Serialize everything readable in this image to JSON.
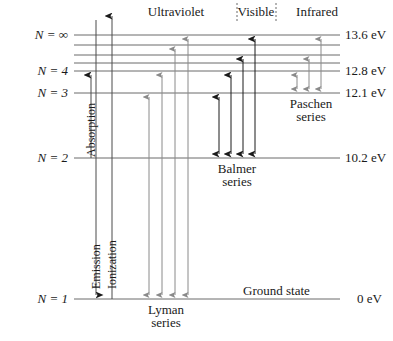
{
  "figure": {
    "type": "energy-level-diagram",
    "width": 393,
    "height": 341,
    "background": "#ffffff",
    "line_color": "#6b6b6b",
    "dark_arrow_color": "#1a1a1a",
    "gray_arrow_color": "#8a8a8a"
  },
  "levels": [
    {
      "name_prefix": "N",
      "eq": "=",
      "value": "∞",
      "label": "N = ∞",
      "energy": "13.6 eV",
      "y": 35,
      "labeled": true
    },
    {
      "name_prefix": "N",
      "eq": "=",
      "value": "7",
      "label": "",
      "energy": "",
      "y": 45,
      "labeled": false
    },
    {
      "name_prefix": "N",
      "eq": "=",
      "value": "6",
      "label": "",
      "energy": "",
      "y": 55,
      "labeled": false
    },
    {
      "name_prefix": "N",
      "eq": "=",
      "value": "5",
      "label": "",
      "energy": "",
      "y": 63,
      "labeled": false
    },
    {
      "name_prefix": "N",
      "eq": "=",
      "value": "4",
      "label": "N = 4",
      "energy": "12.8 eV",
      "y": 71,
      "labeled": true
    },
    {
      "name_prefix": "N",
      "eq": "=",
      "value": "3",
      "label": "N = 3",
      "energy": "12.1 eV",
      "y": 93,
      "labeled": true
    },
    {
      "name_prefix": "N",
      "eq": "=",
      "value": "2",
      "label": "N = 2",
      "energy": "10.2 eV",
      "y": 158,
      "labeled": true
    },
    {
      "name_prefix": "N",
      "eq": "=",
      "value": "1",
      "label": "N = 1",
      "energy": "0 eV",
      "y": 299,
      "labeled": true
    }
  ],
  "energy_axis": {
    "values": [
      "13.6 eV",
      "12.8 eV",
      "12.1 eV",
      "10.2 eV",
      "0 eV"
    ]
  },
  "spectrum_regions": [
    {
      "label": "Ultraviolet",
      "cx": 176,
      "y": 12
    },
    {
      "label": "Visible",
      "cx": 256,
      "y": 12
    },
    {
      "label": "Infrared",
      "cx": 316,
      "y": 12
    }
  ],
  "region_dividers": [
    237,
    276
  ],
  "series": [
    {
      "label_line1": "Lyman",
      "label_line2": "series",
      "cx": 166,
      "label_y": 305,
      "direction": "both",
      "color": "gray"
    },
    {
      "label_line1": "Balmer",
      "label_line2": "series",
      "cx": 237,
      "label_y": 164,
      "direction": "down",
      "color": "dark"
    },
    {
      "label_line1": "Paschen",
      "label_line2": "series",
      "cx": 311,
      "label_y": 99,
      "direction": "both",
      "color": "gray"
    }
  ],
  "process_labels": [
    {
      "label": "Absorption",
      "x": 84,
      "y": 157,
      "rotated": true
    },
    {
      "label": "Emission",
      "x": 89,
      "y": 289,
      "rotated": true
    },
    {
      "label": "Ionization",
      "x": 105,
      "y": 289,
      "rotated": true
    }
  ],
  "ground_state": {
    "label": "Ground state",
    "x": 243,
    "y": 282
  }
}
